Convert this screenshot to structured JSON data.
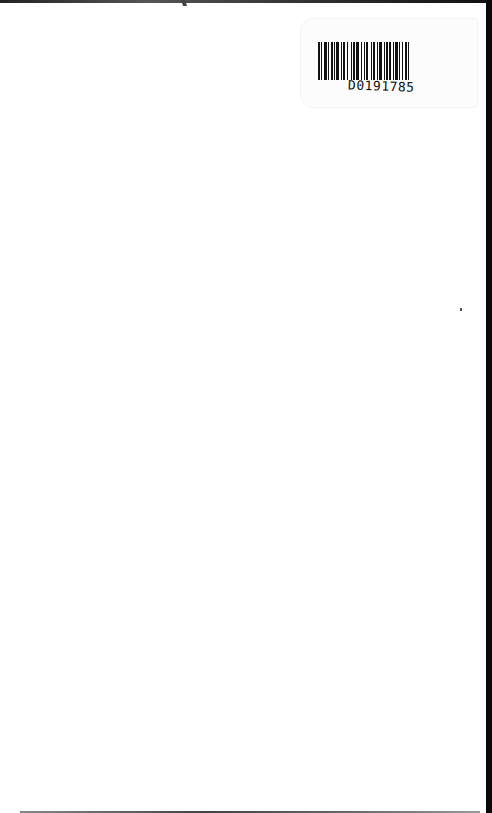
{
  "page": {
    "background": "#ffffff",
    "content": "blank scanned page"
  },
  "barcode_sticker": {
    "barcode_id": "D0191785",
    "bar_color": "#111111"
  },
  "scan_artifacts": {
    "edge_color": "#0a0a0a",
    "speck_color": "#555555"
  }
}
